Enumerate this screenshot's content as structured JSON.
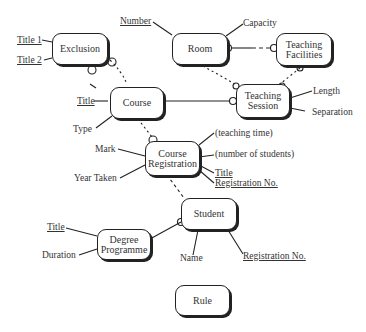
{
  "entities": {
    "exclusion": "Exclusion",
    "room": "Room",
    "teaching_facilities": "Teaching\nFacilities",
    "course": "Course",
    "teaching_session": "Teaching\nSession",
    "course_registration": "Course\nRegistration",
    "student": "Student",
    "degree_programme": "Degree\nProgramme",
    "rule": "Rule"
  },
  "attributes": {
    "exclusion": [
      {
        "label": "Title 1",
        "key": true
      },
      {
        "label": "Title 2",
        "key": true
      }
    ],
    "room": [
      {
        "label": "Number",
        "key": true
      },
      {
        "label": "Capacity",
        "key": false
      }
    ],
    "course": [
      {
        "label": "Title",
        "key": true
      },
      {
        "label": "Type",
        "key": false
      }
    ],
    "teaching_session": [
      {
        "label": "Length",
        "key": false
      },
      {
        "label": "Separation",
        "key": false
      }
    ],
    "course_registration": [
      {
        "label": "Mark",
        "key": false
      },
      {
        "label": "Year Taken",
        "key": false
      },
      {
        "label": "(teaching time)",
        "key": false
      },
      {
        "label": "(number of students)",
        "key": false
      },
      {
        "label": "Title",
        "key": true
      },
      {
        "label": "Registration No.",
        "key": true
      }
    ],
    "student": [
      {
        "label": "Name",
        "key": false
      },
      {
        "label": "Registration No.",
        "key": true
      }
    ],
    "degree_programme": [
      {
        "label": "Title",
        "key": true
      },
      {
        "label": "Duration",
        "key": false
      }
    ]
  }
}
